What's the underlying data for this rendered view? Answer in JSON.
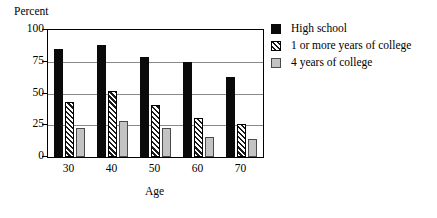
{
  "chart_data": {
    "type": "bar",
    "title": "",
    "ylabel": "Percent",
    "xlabel": "Age",
    "categories": [
      "30",
      "40",
      "50",
      "60",
      "70"
    ],
    "ylim": [
      0,
      100
    ],
    "yticks": [
      "0",
      "25",
      "50",
      "75",
      "100"
    ],
    "ytick_values": [
      0,
      25,
      50,
      75,
      100
    ],
    "grid": true,
    "legend_position": "right",
    "series": [
      {
        "name": "High school",
        "swatch": "solid-black",
        "color": "#0a0a0a",
        "values": [
          85,
          88,
          79,
          75,
          63
        ]
      },
      {
        "name": "1 or more years of college",
        "swatch": "diagonal-hatch",
        "color": "#ffffff",
        "values": [
          43,
          52,
          41,
          31,
          26
        ]
      },
      {
        "name": "4 years of college",
        "swatch": "solid-gray",
        "color": "#c3c3c3",
        "values": [
          23,
          28,
          23,
          16,
          14
        ]
      }
    ]
  },
  "legend": {
    "items": [
      {
        "label": "High school"
      },
      {
        "label": "1 or more years of college"
      },
      {
        "label": "4 years of college"
      }
    ]
  }
}
